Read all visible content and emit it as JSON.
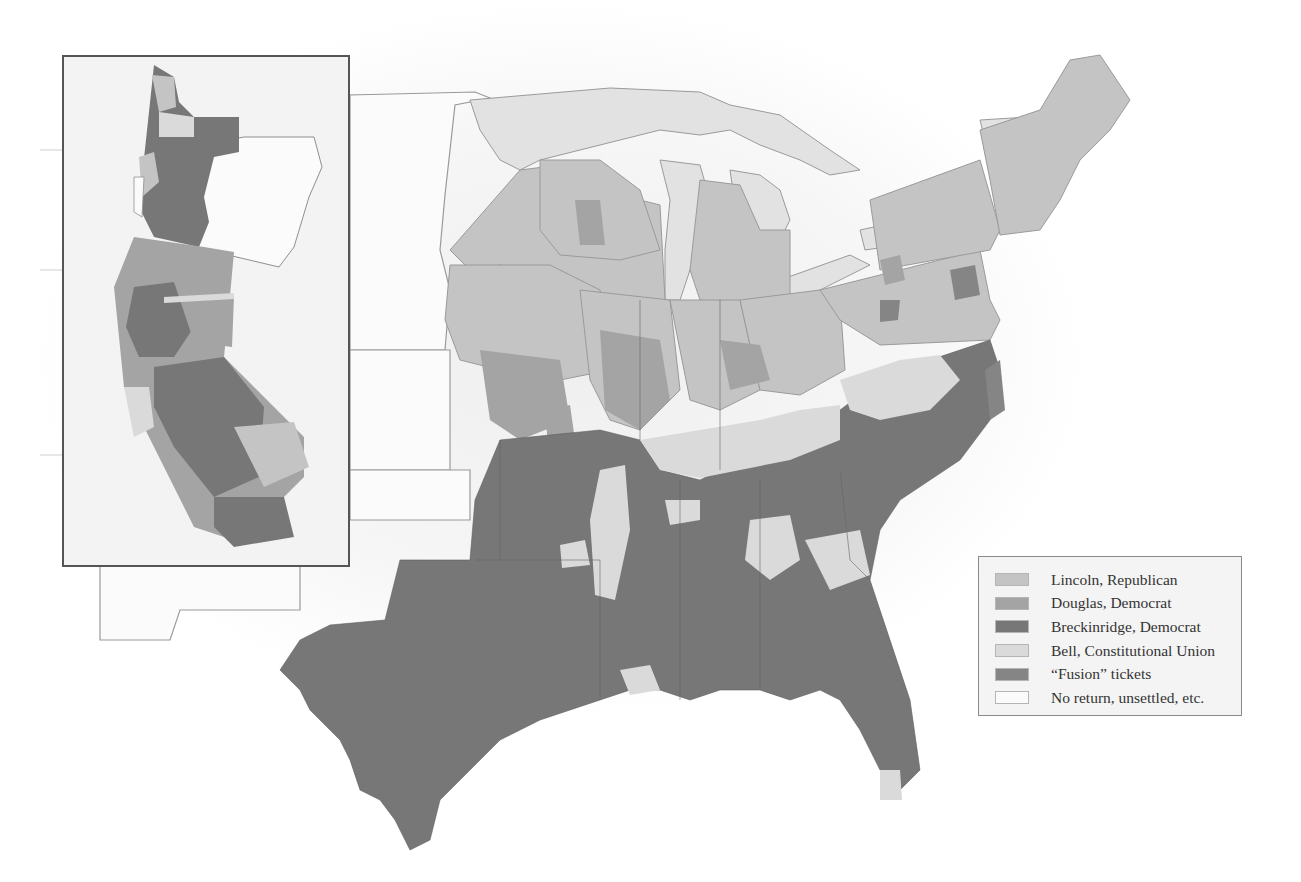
{
  "map": {
    "subject": "1860 U.S. presidential election results by county",
    "inset": {
      "region": "Pacific coast (California and Oregon)"
    },
    "colors": {
      "lincoln": "#c4c4c4",
      "douglas": "#a4a4a4",
      "breckinridge": "#777777",
      "bell": "#dadada",
      "fusion": "#858585",
      "none": "#fbfbfb",
      "water": "#e2e2e2",
      "border": "#8f8f8f"
    }
  },
  "legend": {
    "items": [
      {
        "label": "Lincoln, Republican",
        "color": "#c4c4c4"
      },
      {
        "label": "Douglas, Democrat",
        "color": "#a4a4a4"
      },
      {
        "label": "Breckinridge, Democrat",
        "color": "#777777"
      },
      {
        "label": "Bell, Constitutional Union",
        "color": "#dadada"
      },
      {
        "label": "“Fusion” tickets",
        "color": "#858585"
      },
      {
        "label": "No return, unsettled, etc.",
        "color": "#fbfbfb"
      }
    ]
  }
}
